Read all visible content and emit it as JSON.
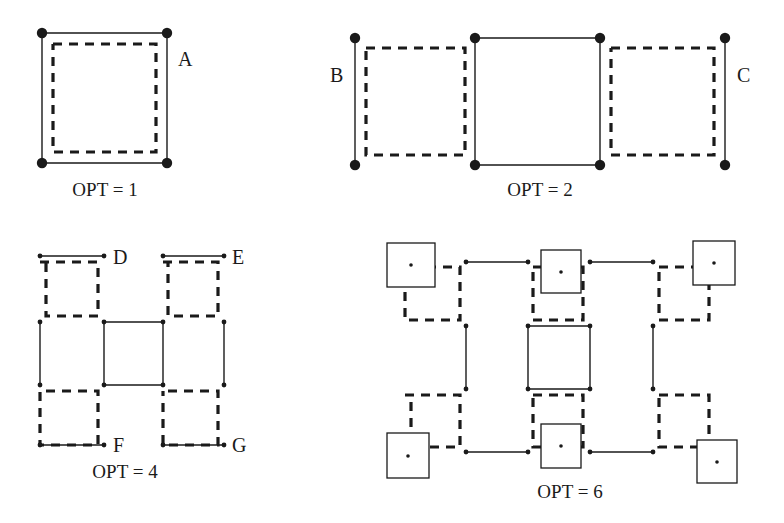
{
  "page": {
    "background_color": "#ffffff",
    "ink_color": "#1a1a1a",
    "width": 784,
    "height": 523
  },
  "style": {
    "solid_stroke_width": 1.4,
    "dashed_stroke_width": 3.2,
    "dash_pattern": "9,7",
    "big_dot_radius": 5.2,
    "small_dot_radius": 2.4,
    "tiny_dot_radius": 1.8,
    "box_stroke_width": 1.3
  },
  "figures": [
    {
      "id": "fig-opt-1",
      "caption": "OPT = 1",
      "caption_x": 105,
      "caption_y": 196,
      "labels": [
        {
          "name": "label-A",
          "text": "A",
          "x": 178,
          "y": 66
        }
      ],
      "solid_paths": [
        {
          "name": "outer-square-solid",
          "points": [
            [
              42,
              33
            ],
            [
              167,
              33
            ],
            [
              167,
              163
            ],
            [
              42,
              163
            ],
            [
              42,
              33
            ]
          ]
        }
      ],
      "dashed_paths": [
        {
          "name": "inner-square-dashed",
          "points": [
            [
              53,
              44
            ],
            [
              156,
              44
            ],
            [
              156,
              152
            ],
            [
              53,
              152
            ],
            [
              53,
              44
            ]
          ]
        }
      ],
      "big_dots": [
        {
          "name": "vertex-top-left",
          "x": 42,
          "y": 33
        },
        {
          "name": "vertex-top-right",
          "x": 167,
          "y": 33
        },
        {
          "name": "vertex-bottom-left",
          "x": 42,
          "y": 163
        },
        {
          "name": "vertex-bottom-right",
          "x": 167,
          "y": 163
        }
      ],
      "small_dots": [],
      "boxes": [],
      "tiny_dots": []
    },
    {
      "id": "fig-opt-2",
      "caption": "OPT = 2",
      "caption_x": 540,
      "caption_y": 196,
      "labels": [
        {
          "name": "label-B",
          "text": "B",
          "x": 330,
          "y": 82
        },
        {
          "name": "label-C",
          "text": "C",
          "x": 737,
          "y": 82
        }
      ],
      "solid_paths": [
        {
          "name": "left-edge-solid",
          "points": [
            [
              355,
              38
            ],
            [
              355,
              165
            ]
          ]
        },
        {
          "name": "middle-square-solid",
          "points": [
            [
              475,
              38
            ],
            [
              600,
              38
            ],
            [
              600,
              165
            ],
            [
              475,
              165
            ],
            [
              475,
              38
            ]
          ]
        },
        {
          "name": "right-edge-solid",
          "points": [
            [
              725,
              38
            ],
            [
              725,
              165
            ]
          ]
        }
      ],
      "dashed_paths": [
        {
          "name": "left-square-dashed",
          "points": [
            [
              366,
              48
            ],
            [
              465,
              48
            ],
            [
              465,
              155
            ],
            [
              366,
              155
            ],
            [
              366,
              48
            ]
          ]
        },
        {
          "name": "right-square-dashed",
          "points": [
            [
              611,
              48
            ],
            [
              714,
              48
            ],
            [
              714,
              155
            ],
            [
              611,
              155
            ],
            [
              611,
              48
            ]
          ]
        }
      ],
      "big_dots": [
        {
          "name": "vertex-left-top",
          "x": 355,
          "y": 38
        },
        {
          "name": "vertex-left-bottom",
          "x": 355,
          "y": 165
        },
        {
          "name": "vertex-middle-top-left",
          "x": 475,
          "y": 38
        },
        {
          "name": "vertex-middle-top-right",
          "x": 600,
          "y": 38
        },
        {
          "name": "vertex-middle-bottom-left",
          "x": 475,
          "y": 165
        },
        {
          "name": "vertex-middle-bottom-right",
          "x": 600,
          "y": 165
        },
        {
          "name": "vertex-right-top",
          "x": 725,
          "y": 38
        },
        {
          "name": "vertex-right-bottom",
          "x": 725,
          "y": 165
        }
      ],
      "small_dots": [],
      "boxes": [],
      "tiny_dots": []
    },
    {
      "id": "fig-opt-4",
      "caption": "OPT = 4",
      "caption_x": 125,
      "caption_y": 478,
      "labels": [
        {
          "name": "label-D",
          "text": "D",
          "x": 113,
          "y": 264
        },
        {
          "name": "label-E",
          "text": "E",
          "x": 232,
          "y": 264
        },
        {
          "name": "label-F",
          "text": "F",
          "x": 113,
          "y": 452
        },
        {
          "name": "label-G",
          "text": "G",
          "x": 232,
          "y": 452
        }
      ],
      "solid_paths": [
        {
          "name": "top-left-solid-edge",
          "points": [
            [
              40,
              256
            ],
            [
              104,
              256
            ]
          ]
        },
        {
          "name": "top-right-solid-edge",
          "points": [
            [
              163,
              256
            ],
            [
              224,
              256
            ]
          ]
        },
        {
          "name": "left-solid-edge",
          "points": [
            [
              40,
              322
            ],
            [
              40,
              385
            ]
          ]
        },
        {
          "name": "right-solid-edge",
          "points": [
            [
              224,
              322
            ],
            [
              224,
              385
            ]
          ]
        },
        {
          "name": "center-square-solid",
          "points": [
            [
              104,
              322
            ],
            [
              163,
              322
            ],
            [
              163,
              385
            ],
            [
              104,
              385
            ],
            [
              104,
              322
            ]
          ]
        },
        {
          "name": "bottom-left-solid-edge",
          "points": [
            [
              40,
              445
            ],
            [
              104,
              445
            ]
          ]
        },
        {
          "name": "bottom-right-solid-edge",
          "points": [
            [
              163,
              445
            ],
            [
              224,
              445
            ]
          ]
        }
      ],
      "dashed_paths": [
        {
          "name": "top-left-cell-dashed",
          "points": [
            [
              40,
              262
            ],
            [
              98,
              262
            ],
            [
              98,
              316
            ],
            [
              46,
              316
            ],
            [
              46,
              262
            ]
          ]
        },
        {
          "name": "top-right-cell-dashed",
          "points": [
            [
              163,
              262
            ],
            [
              218,
              262
            ],
            [
              218,
              316
            ],
            [
              168,
              316
            ],
            [
              168,
              262
            ]
          ]
        },
        {
          "name": "bottom-left-cell-dashed",
          "points": [
            [
              46,
              391
            ],
            [
              98,
              391
            ],
            [
              98,
              445
            ],
            [
              40,
              445
            ],
            [
              40,
              391
            ]
          ]
        },
        {
          "name": "bottom-right-cell-dashed",
          "points": [
            [
              168,
              391
            ],
            [
              218,
              391
            ],
            [
              218,
              445
            ],
            [
              163,
              445
            ],
            [
              163,
              391
            ]
          ]
        }
      ],
      "big_dots": [],
      "small_dots": [
        {
          "name": "node-top-left",
          "x": 40,
          "y": 256
        },
        {
          "name": "node-top-mid-left",
          "x": 104,
          "y": 256
        },
        {
          "name": "node-top-mid-right",
          "x": 163,
          "y": 256
        },
        {
          "name": "node-top-right",
          "x": 224,
          "y": 256
        },
        {
          "name": "node-mid-upper-left",
          "x": 40,
          "y": 322
        },
        {
          "name": "node-center-top-left",
          "x": 104,
          "y": 322
        },
        {
          "name": "node-center-top-right",
          "x": 163,
          "y": 322
        },
        {
          "name": "node-mid-upper-right",
          "x": 224,
          "y": 322
        },
        {
          "name": "node-mid-lower-left",
          "x": 40,
          "y": 385
        },
        {
          "name": "node-center-bottom-left",
          "x": 104,
          "y": 385
        },
        {
          "name": "node-center-bottom-right",
          "x": 163,
          "y": 385
        },
        {
          "name": "node-mid-lower-right",
          "x": 224,
          "y": 385
        },
        {
          "name": "node-bottom-left",
          "x": 40,
          "y": 445
        },
        {
          "name": "node-bottom-mid-left",
          "x": 104,
          "y": 445
        },
        {
          "name": "node-bottom-mid-right",
          "x": 163,
          "y": 445
        },
        {
          "name": "node-bottom-right",
          "x": 224,
          "y": 445
        }
      ],
      "boxes": [],
      "tiny_dots": []
    },
    {
      "id": "fig-opt-6",
      "caption": "OPT = 6",
      "caption_x": 570,
      "caption_y": 498,
      "labels": [],
      "solid_paths": [
        {
          "name": "top-left-solid-edge",
          "points": [
            [
              466,
              262
            ],
            [
              528,
              262
            ]
          ]
        },
        {
          "name": "top-right-solid-edge",
          "points": [
            [
              590,
              262
            ],
            [
              653,
              262
            ]
          ]
        },
        {
          "name": "left-solid-edge",
          "points": [
            [
              466,
              326
            ],
            [
              466,
              389
            ]
          ]
        },
        {
          "name": "right-solid-edge",
          "points": [
            [
              653,
              326
            ],
            [
              653,
              389
            ]
          ]
        },
        {
          "name": "center-square-solid",
          "points": [
            [
              528,
              326
            ],
            [
              590,
              326
            ],
            [
              590,
              389
            ],
            [
              528,
              389
            ],
            [
              528,
              326
            ]
          ]
        },
        {
          "name": "bottom-left-solid-edge",
          "points": [
            [
              466,
              452
            ],
            [
              528,
              452
            ]
          ]
        },
        {
          "name": "bottom-right-solid-edge",
          "points": [
            [
              590,
              452
            ],
            [
              653,
              452
            ]
          ]
        }
      ],
      "dashed_paths": [
        {
          "name": "top-left-cell-dashed",
          "points": [
            [
              411,
              267
            ],
            [
              460,
              267
            ],
            [
              460,
              320
            ],
            [
              405,
              320
            ],
            [
              405,
              267
            ]
          ]
        },
        {
          "name": "top-mid-cell-dashed",
          "points": [
            [
              533,
              267
            ],
            [
              583,
              267
            ],
            [
              583,
              320
            ],
            [
              533,
              320
            ],
            [
              533,
              267
            ]
          ]
        },
        {
          "name": "top-right-cell-dashed",
          "points": [
            [
              659,
              267
            ],
            [
              709,
              267
            ],
            [
              709,
              320
            ],
            [
              659,
              320
            ],
            [
              659,
              267
            ]
          ]
        },
        {
          "name": "bottom-left-cell-dashed",
          "points": [
            [
              405,
              395
            ],
            [
              460,
              395
            ],
            [
              460,
              447
            ],
            [
              411,
              447
            ],
            [
              411,
              395
            ]
          ]
        },
        {
          "name": "bottom-mid-cell-dashed",
          "points": [
            [
              533,
              395
            ],
            [
              583,
              395
            ],
            [
              583,
              447
            ],
            [
              533,
              447
            ],
            [
              533,
              395
            ]
          ]
        },
        {
          "name": "bottom-right-cell-dashed",
          "points": [
            [
              659,
              395
            ],
            [
              709,
              395
            ],
            [
              709,
              447
            ],
            [
              659,
              447
            ],
            [
              659,
              395
            ]
          ]
        }
      ],
      "big_dots": [],
      "small_dots": [
        {
          "name": "node-top-left-inner",
          "x": 466,
          "y": 262
        },
        {
          "name": "node-top-mid-left",
          "x": 528,
          "y": 262
        },
        {
          "name": "node-top-mid-right",
          "x": 590,
          "y": 262
        },
        {
          "name": "node-top-right-inner",
          "x": 653,
          "y": 262
        },
        {
          "name": "node-mid-upper-left",
          "x": 466,
          "y": 326
        },
        {
          "name": "node-center-top-left",
          "x": 528,
          "y": 326
        },
        {
          "name": "node-center-top-right",
          "x": 590,
          "y": 326
        },
        {
          "name": "node-mid-upper-right",
          "x": 653,
          "y": 326
        },
        {
          "name": "node-mid-lower-left",
          "x": 466,
          "y": 389
        },
        {
          "name": "node-center-bottom-left",
          "x": 528,
          "y": 389
        },
        {
          "name": "node-center-bottom-right",
          "x": 590,
          "y": 389
        },
        {
          "name": "node-mid-lower-right",
          "x": 653,
          "y": 389
        },
        {
          "name": "node-bottom-left-inner",
          "x": 466,
          "y": 452
        },
        {
          "name": "node-bottom-mid-left",
          "x": 528,
          "y": 452
        },
        {
          "name": "node-bottom-mid-right",
          "x": 590,
          "y": 452
        },
        {
          "name": "node-bottom-right-inner",
          "x": 653,
          "y": 452
        }
      ],
      "boxes": [
        {
          "name": "box-top-left",
          "x": 387,
          "y": 243,
          "w": 48,
          "h": 44
        },
        {
          "name": "box-top-mid",
          "x": 541,
          "y": 250,
          "w": 40,
          "h": 43
        },
        {
          "name": "box-top-right",
          "x": 693,
          "y": 241,
          "w": 42,
          "h": 44
        },
        {
          "name": "box-bottom-left",
          "x": 387,
          "y": 433,
          "w": 42,
          "h": 45
        },
        {
          "name": "box-bottom-mid",
          "x": 541,
          "y": 424,
          "w": 40,
          "h": 44
        },
        {
          "name": "box-bottom-right",
          "x": 697,
          "y": 440,
          "w": 40,
          "h": 43
        }
      ],
      "tiny_dots": [
        {
          "name": "box-center-dot-top-left",
          "x": 411,
          "y": 265
        },
        {
          "name": "box-center-dot-top-mid",
          "x": 561,
          "y": 272
        },
        {
          "name": "box-center-dot-top-right",
          "x": 714,
          "y": 263
        },
        {
          "name": "box-center-dot-bottom-left",
          "x": 408,
          "y": 456
        },
        {
          "name": "box-center-dot-bottom-mid",
          "x": 561,
          "y": 446
        },
        {
          "name": "box-center-dot-bottom-right",
          "x": 717,
          "y": 462
        }
      ]
    }
  ]
}
